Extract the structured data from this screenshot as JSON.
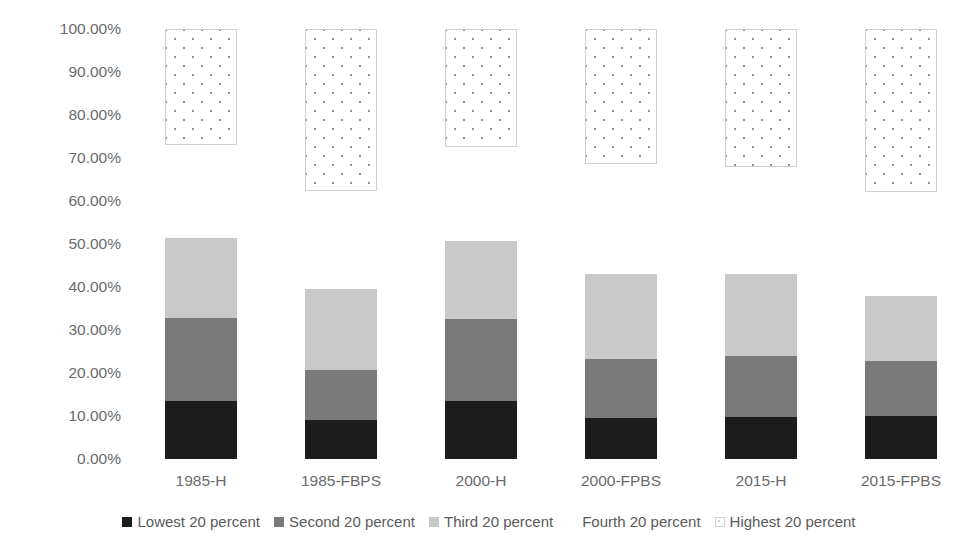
{
  "chart_data": {
    "type": "bar",
    "subtype": "stacked-column",
    "title": "",
    "xlabel": "",
    "ylabel": "",
    "ylim": [
      0,
      100
    ],
    "grid": false,
    "legend_position": "bottom",
    "y_tick_labels": [
      "100.00%",
      "90.00%",
      "80.00%",
      "70.00%",
      "60.00%",
      "50.00%",
      "40.00%",
      "30.00%",
      "20.00%",
      "10.00%",
      "0.00%"
    ],
    "y_tick_values": [
      100,
      90,
      80,
      70,
      60,
      50,
      40,
      30,
      20,
      10,
      0
    ],
    "categories": [
      "1985-H",
      "1985-FBPS",
      "2000-H",
      "2000-FPBS",
      "2015-H",
      "2015-FPBS"
    ],
    "series": [
      {
        "name": "Lowest 20 percent",
        "color": "#1c1c1c",
        "values": [
          13.5,
          9.0,
          13.5,
          9.5,
          9.8,
          10.0
        ]
      },
      {
        "name": "Second 20 percent",
        "color": "#7a7a7a",
        "values": [
          19.4,
          11.8,
          19.0,
          13.8,
          14.2,
          12.8
        ]
      },
      {
        "name": "Third 20 percent",
        "color": "#c9c9c9",
        "values": [
          18.6,
          18.7,
          18.2,
          19.7,
          19.0,
          15.2
        ]
      },
      {
        "name": "Fourth 20 percent",
        "color": "#ffffff",
        "values": [
          21.5,
          22.9,
          21.8,
          25.5,
          25.0,
          24.0
        ]
      },
      {
        "name": "Highest 20 percent",
        "color": "#ffffff",
        "pattern": "dotted",
        "values": [
          27.0,
          37.6,
          27.5,
          31.5,
          32.0,
          38.0
        ]
      }
    ],
    "stack_tops_visible_lower": [
      51.5,
      39.5,
      50.7,
      43.0,
      43.0,
      38.0
    ],
    "highest_band_bottom": [
      73.0,
      62.4,
      72.5,
      68.5,
      68.0,
      62.0
    ],
    "highest_band_top": [
      100,
      100,
      100,
      100,
      100,
      100
    ]
  },
  "legend": {
    "items": [
      {
        "label": "Lowest 20 percent",
        "swatch": "sw-lowest"
      },
      {
        "label": "Second 20 percent",
        "swatch": "sw-second"
      },
      {
        "label": "Third 20 percent",
        "swatch": "sw-third"
      },
      {
        "label": "Fourth 20 percent",
        "swatch": "sw-fourth"
      },
      {
        "label": "Highest 20 percent",
        "swatch": "sw-highest"
      }
    ]
  }
}
